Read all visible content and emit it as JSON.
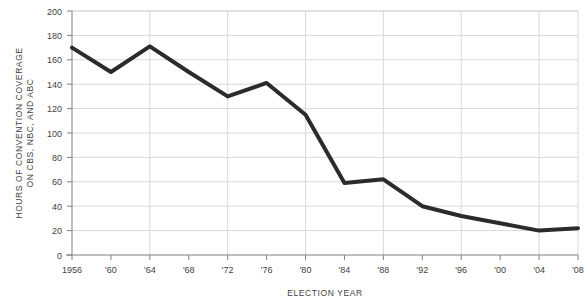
{
  "chart_data": {
    "type": "line",
    "title": "",
    "xlabel": "ELECTION YEAR",
    "ylabel": "HOURS OF CONVENTION COVERAGE ON CBS, NBC, AND ABC",
    "ylabel_line1": "HOURS OF CONVENTION COVERAGE",
    "ylabel_line2": "ON CBS, NBC, AND ABC",
    "categories": [
      "1956",
      "'60",
      "'64",
      "'68",
      "'72",
      "'76",
      "'80",
      "'84",
      "'88",
      "'92",
      "'96",
      "'00",
      "'04",
      "'08"
    ],
    "x": [
      1956,
      1960,
      1964,
      1968,
      1972,
      1976,
      1980,
      1984,
      1988,
      1992,
      1996,
      2000,
      2004,
      2008
    ],
    "values": [
      170,
      150,
      171,
      150,
      130,
      141,
      115,
      59,
      62,
      40,
      32,
      26,
      20,
      22
    ],
    "ylim": [
      0,
      200
    ],
    "yticks": [
      0,
      20,
      40,
      60,
      80,
      100,
      120,
      140,
      160,
      180,
      200
    ],
    "ytick_labels": [
      "0",
      "20",
      "40",
      "60",
      "80",
      "100",
      "120",
      "140",
      "160",
      "180",
      "200"
    ],
    "xlim": [
      1956,
      2008
    ],
    "grid": true,
    "grid_x_interval_years": 8,
    "legend": null,
    "line_color": "#2b2b2b",
    "grid_color": "#d8d8d8",
    "axis_color": "#808080",
    "line_width": 4
  }
}
